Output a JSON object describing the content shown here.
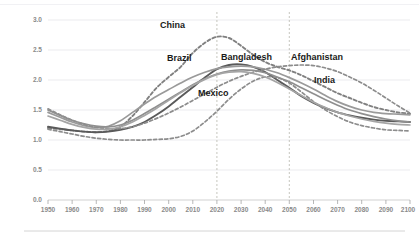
{
  "chart_data": {
    "type": "line",
    "title": "",
    "xlabel": "",
    "ylabel": "",
    "xlim": [
      1950,
      2100
    ],
    "ylim": [
      0.0,
      3.0
    ],
    "grid": true,
    "legend_position": "inline-labels",
    "x_ticks": [
      "1950",
      "1960",
      "1970",
      "1980",
      "1990",
      "2000",
      "2010",
      "2020",
      "2030",
      "2040",
      "2050",
      "2060",
      "2070",
      "2080",
      "2090",
      "2100"
    ],
    "y_ticks": [
      "0.0",
      "0.5",
      "1.0",
      "1.5",
      "2.0",
      "2.5",
      "3.0"
    ],
    "annotations": [
      {
        "name": "vertical-marker-2020",
        "x": 2020,
        "style": "dashed"
      },
      {
        "name": "vertical-marker-2050",
        "x": 2050,
        "style": "dashed"
      }
    ],
    "x": [
      1950,
      1955,
      1960,
      1965,
      1970,
      1975,
      1980,
      1985,
      1990,
      1995,
      2000,
      2005,
      2010,
      2015,
      2020,
      2025,
      2030,
      2035,
      2040,
      2045,
      2050,
      2055,
      2060,
      2065,
      2070,
      2075,
      2080,
      2085,
      2090,
      2095,
      2100
    ],
    "series": [
      {
        "name": "China",
        "label": "China",
        "style": "dashed",
        "color": "#808080",
        "values": [
          1.2,
          1.18,
          1.16,
          1.14,
          1.13,
          1.15,
          1.22,
          1.4,
          1.63,
          1.87,
          2.05,
          2.22,
          2.45,
          2.62,
          2.72,
          2.7,
          2.57,
          2.42,
          2.3,
          2.22,
          2.16,
          2.08,
          1.98,
          1.88,
          1.78,
          1.7,
          1.62,
          1.55,
          1.5,
          1.46,
          1.44
        ]
      },
      {
        "name": "Brazil",
        "label": "Brazil",
        "style": "solid",
        "color": "#5a5a5a",
        "values": [
          1.22,
          1.19,
          1.16,
          1.14,
          1.13,
          1.14,
          1.17,
          1.22,
          1.3,
          1.42,
          1.56,
          1.72,
          1.88,
          2.04,
          2.18,
          2.25,
          2.26,
          2.22,
          2.13,
          2.0,
          1.87,
          1.73,
          1.62,
          1.53,
          1.46,
          1.41,
          1.37,
          1.34,
          1.32,
          1.31,
          1.3
        ]
      },
      {
        "name": "Bangladesh",
        "label": "Bangladesh",
        "style": "solid",
        "color": "#9a9a9a",
        "values": [
          1.46,
          1.38,
          1.3,
          1.24,
          1.21,
          1.23,
          1.32,
          1.46,
          1.6,
          1.73,
          1.84,
          1.95,
          2.05,
          2.13,
          2.19,
          2.22,
          2.23,
          2.22,
          2.18,
          2.12,
          2.04,
          1.95,
          1.85,
          1.74,
          1.64,
          1.56,
          1.5,
          1.46,
          1.44,
          1.43,
          1.42
        ]
      },
      {
        "name": "Mexico",
        "label": "Mexico",
        "style": "dashed",
        "color": "#8c8c8c",
        "values": [
          1.18,
          1.14,
          1.1,
          1.06,
          1.03,
          1.01,
          1.0,
          1.0,
          1.0,
          1.01,
          1.02,
          1.06,
          1.15,
          1.3,
          1.48,
          1.68,
          1.85,
          1.98,
          2.05,
          2.04,
          1.95,
          1.8,
          1.64,
          1.5,
          1.39,
          1.3,
          1.24,
          1.2,
          1.17,
          1.16,
          1.15
        ]
      },
      {
        "name": "Afghanistan",
        "label": "Afghanistan",
        "style": "dashed",
        "color": "#8c8c8c",
        "values": [
          1.52,
          1.42,
          1.33,
          1.26,
          1.21,
          1.19,
          1.19,
          1.22,
          1.28,
          1.36,
          1.45,
          1.55,
          1.66,
          1.77,
          1.88,
          1.98,
          2.06,
          2.13,
          2.18,
          2.22,
          2.24,
          2.25,
          2.24,
          2.2,
          2.14,
          2.05,
          1.95,
          1.83,
          1.7,
          1.57,
          1.45
        ]
      },
      {
        "name": "India",
        "label": "India",
        "style": "solid",
        "color": "#8f8f8f",
        "values": [
          1.5,
          1.41,
          1.33,
          1.27,
          1.23,
          1.22,
          1.25,
          1.33,
          1.44,
          1.56,
          1.68,
          1.8,
          1.92,
          2.02,
          2.1,
          2.15,
          2.17,
          2.16,
          2.12,
          2.05,
          1.97,
          1.87,
          1.77,
          1.67,
          1.58,
          1.5,
          1.44,
          1.39,
          1.35,
          1.32,
          1.3
        ]
      },
      {
        "name": "series-7",
        "label": "",
        "style": "solid",
        "color": "#a5a5a5",
        "values": [
          1.4,
          1.33,
          1.26,
          1.21,
          1.18,
          1.18,
          1.22,
          1.3,
          1.41,
          1.53,
          1.66,
          1.79,
          1.91,
          2.01,
          2.09,
          2.13,
          2.14,
          2.11,
          2.05,
          1.96,
          1.85,
          1.74,
          1.63,
          1.54,
          1.46,
          1.4,
          1.35,
          1.31,
          1.28,
          1.26,
          1.25
        ]
      }
    ]
  },
  "axis": {
    "y_ticks": [
      "3.0",
      "2.5",
      "2.0",
      "1.5",
      "1.0",
      "0.5",
      "0.0"
    ],
    "x_ticks": [
      "1950",
      "1960",
      "1970",
      "1980",
      "1990",
      "2000",
      "2010",
      "2020",
      "2030",
      "2040",
      "2050",
      "2060",
      "2070",
      "2080",
      "2090",
      "2100"
    ]
  },
  "labels": {
    "china": "China",
    "brazil": "Brazil",
    "bangladesh": "Bangladesh",
    "mexico": "Mexico",
    "afghanistan": "Afghanistan",
    "india": "India"
  },
  "colors": {
    "grid": "#e3e3e6",
    "tick_text": "#8a8a8a",
    "label_text": "#1a1a1a",
    "marker_line": "#b9b9ae"
  }
}
